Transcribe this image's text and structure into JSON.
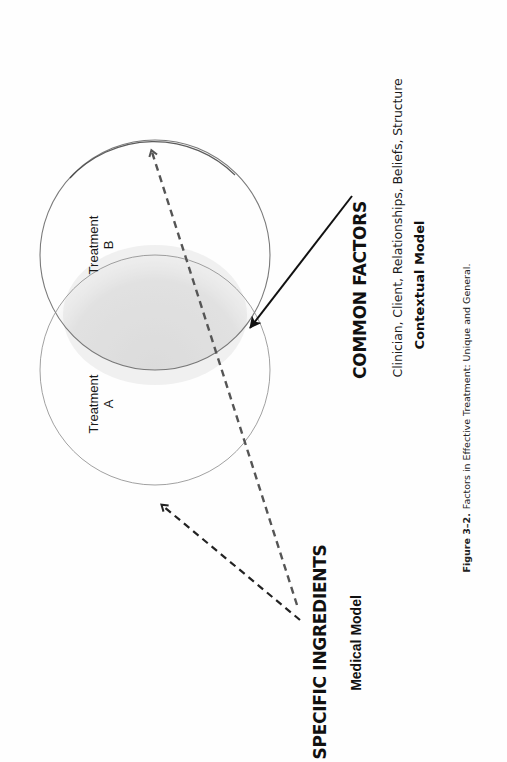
{
  "figure": {
    "orientation": "rotated-90-ccw",
    "caption": {
      "number": "Figure 3–2.",
      "text": "Factors in Effective Treatment: Unique and General."
    }
  },
  "circles": [
    {
      "id": "treatment-b",
      "label_line1": "Treatment",
      "label_line2": "B"
    },
    {
      "id": "treatment-a",
      "label_line1": "Treatment",
      "label_line2": "A"
    }
  ],
  "overlap": {
    "meaning": "common factors",
    "fill_color": "#d9d9d9"
  },
  "common_factors": {
    "title": "COMMON FACTORS",
    "items_text": "Clinician, Client, Relationships, Beliefs, Structure",
    "model": "Contextual Model",
    "arrow_style": "solid"
  },
  "specific_ingredients": {
    "title": "SPECIFIC INGREDIENTS",
    "model": "Medical Model",
    "arrow_style": "dashed",
    "arrow_targets": [
      "Treatment B",
      "Treatment A"
    ]
  },
  "colors": {
    "circle_stroke": "#555555",
    "arrow": "#111111",
    "dashed_arrow_b": "#555555",
    "dashed_arrow_a": "#222222",
    "background": "#ffffff"
  }
}
